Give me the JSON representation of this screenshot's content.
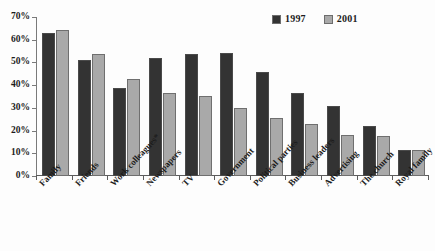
{
  "chart_data": {
    "type": "bar",
    "title": "",
    "subtitle": "",
    "xlabel": "",
    "ylabel": "",
    "ylim": [
      0,
      70
    ],
    "ytick_step": 10,
    "ytick_labels": [
      "0%",
      "10%",
      "20%",
      "30%",
      "40%",
      "50%",
      "60%",
      "70%"
    ],
    "ytick_values": [
      0,
      10,
      20,
      30,
      40,
      50,
      60,
      70
    ],
    "grid": false,
    "legend_position": "top-right",
    "categories": [
      "Family",
      "Friends",
      "Work colleagues*",
      "Newspapers",
      "TV",
      "Government",
      "Political parties",
      "Business leaders",
      "Advertising",
      "The church",
      "Royal family"
    ],
    "series": [
      {
        "name": "1997",
        "color": "#333333",
        "values": [
          63,
          51,
          38.8,
          52,
          53.6,
          54.2,
          45.8,
          36.7,
          30.9,
          22.2,
          11.6
        ]
      },
      {
        "name": "2001",
        "color": "#a9a9a9",
        "values": [
          64.5,
          53.6,
          42.7,
          36.7,
          35.4,
          30.1,
          25.4,
          22.7,
          17.9,
          17.7,
          11.6
        ]
      }
    ]
  },
  "legend": {
    "entries": [
      {
        "label": "1997",
        "color": "#333333"
      },
      {
        "label": "2001",
        "color": "#a9a9a9"
      }
    ]
  },
  "axes": {
    "y_axis_color": "#7a7a7a",
    "x_axis_color": "#5c5c5c"
  }
}
